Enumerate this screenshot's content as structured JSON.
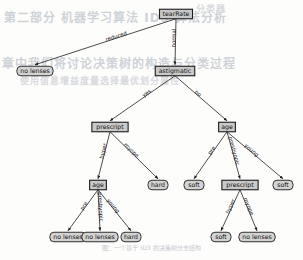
{
  "figure": {
    "caption": "图：一个基于 ID3 的决策树分支结构"
  },
  "background_text": {
    "line1": "第二部分 机器学习算法 ID3 算法分析",
    "line2": "章中我们将讨论决策树的构造与分类过程",
    "line3": "使用信息增益度量选择最优划分属性",
    "line4": "分类器"
  },
  "chart_data": {
    "type": "tree",
    "root": "tearRate",
    "nodes": [
      {
        "id": "n0",
        "label": "tearRate",
        "kind": "internal",
        "x": 176,
        "y": 14
      },
      {
        "id": "n1",
        "label": "no lenses",
        "kind": "leaf",
        "x": 35,
        "y": 71
      },
      {
        "id": "n2",
        "label": "astigmatic",
        "kind": "internal",
        "x": 175,
        "y": 71
      },
      {
        "id": "n3",
        "label": "prescript",
        "kind": "internal",
        "x": 110,
        "y": 127
      },
      {
        "id": "n4",
        "label": "age",
        "kind": "internal",
        "x": 227,
        "y": 127
      },
      {
        "id": "n5",
        "label": "age",
        "kind": "internal",
        "x": 98,
        "y": 185
      },
      {
        "id": "n6",
        "label": "hard",
        "kind": "leaf",
        "x": 158,
        "y": 185
      },
      {
        "id": "n7",
        "label": "soft",
        "kind": "leaf",
        "x": 194,
        "y": 185
      },
      {
        "id": "n8",
        "label": "prescript",
        "kind": "internal",
        "x": 240,
        "y": 185
      },
      {
        "id": "n9",
        "label": "soft",
        "kind": "leaf",
        "x": 283,
        "y": 185
      },
      {
        "id": "n10",
        "label": "no lenses",
        "kind": "leaf",
        "x": 68,
        "y": 237
      },
      {
        "id": "n11",
        "label": "no lenses",
        "kind": "leaf",
        "x": 100,
        "y": 237
      },
      {
        "id": "n12",
        "label": "hard",
        "kind": "leaf",
        "x": 131,
        "y": 237
      },
      {
        "id": "n13",
        "label": "soft",
        "kind": "leaf",
        "x": 221,
        "y": 237
      },
      {
        "id": "n14",
        "label": "no lenses",
        "kind": "leaf",
        "x": 257,
        "y": 237
      }
    ],
    "edges": [
      {
        "from": "n0",
        "to": "n1",
        "label": "reduced"
      },
      {
        "from": "n0",
        "to": "n2",
        "label": "normal"
      },
      {
        "from": "n2",
        "to": "n3",
        "label": "yes"
      },
      {
        "from": "n2",
        "to": "n4",
        "label": "no"
      },
      {
        "from": "n3",
        "to": "n5",
        "label": "hyper"
      },
      {
        "from": "n3",
        "to": "n6",
        "label": "myope"
      },
      {
        "from": "n4",
        "to": "n7",
        "label": "pre"
      },
      {
        "from": "n4",
        "to": "n8",
        "label": "presbyopic"
      },
      {
        "from": "n4",
        "to": "n9",
        "label": "young"
      },
      {
        "from": "n5",
        "to": "n10",
        "label": "pre"
      },
      {
        "from": "n5",
        "to": "n11",
        "label": "presbyopic"
      },
      {
        "from": "n5",
        "to": "n12",
        "label": "young"
      },
      {
        "from": "n8",
        "to": "n13",
        "label": "hyper"
      },
      {
        "from": "n8",
        "to": "n14",
        "label": "myope"
      }
    ],
    "classes": [
      "no lenses",
      "hard",
      "soft"
    ],
    "attributes": [
      "tearRate",
      "astigmatic",
      "prescript",
      "age"
    ]
  }
}
